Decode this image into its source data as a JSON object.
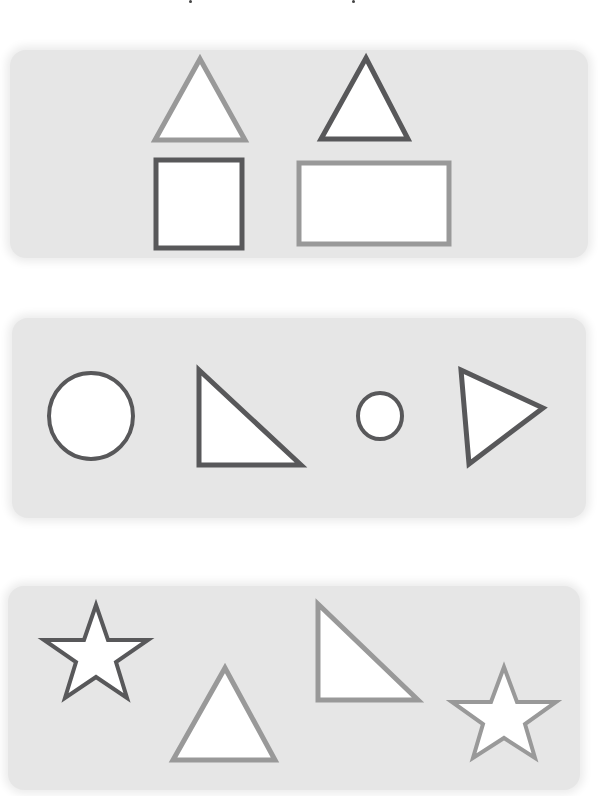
{
  "page": {
    "width": 598,
    "height": 796,
    "background": "#ffffff"
  },
  "colors": {
    "dark_stroke": "#58585a",
    "light_stroke": "#999999",
    "panel_fill": "#e6e6e6",
    "shape_fill": "#ffffff"
  },
  "panels": [
    {
      "name": "panel-1",
      "shapes": [
        "light-triangle",
        "dark-triangle",
        "dark-square",
        "light-rectangle"
      ]
    },
    {
      "name": "panel-2",
      "shapes": [
        "dark-large-circle",
        "dark-right-triangle",
        "dark-small-circle",
        "dark-triangle-pointing-right"
      ]
    },
    {
      "name": "panel-3",
      "shapes": [
        "dark-star",
        "light-triangle",
        "light-right-triangle",
        "light-star"
      ]
    }
  ]
}
